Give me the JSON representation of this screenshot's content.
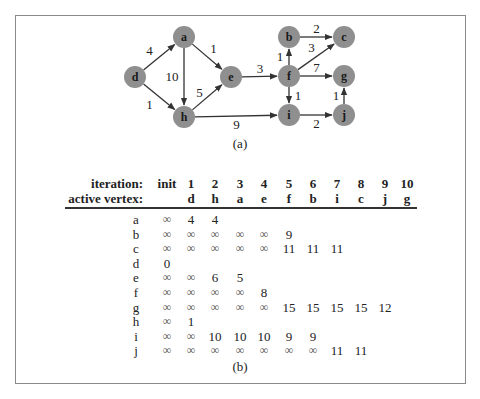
{
  "graph": {
    "caption": "(a)",
    "node_color": "#8f8f8f",
    "nodes": [
      {
        "id": "d",
        "x": 135,
        "y": 77
      },
      {
        "id": "a",
        "x": 184,
        "y": 37
      },
      {
        "id": "h",
        "x": 184,
        "y": 117
      },
      {
        "id": "e",
        "x": 231,
        "y": 77
      },
      {
        "id": "f",
        "x": 289,
        "y": 76
      },
      {
        "id": "b",
        "x": 289,
        "y": 37
      },
      {
        "id": "c",
        "x": 344,
        "y": 37
      },
      {
        "id": "g",
        "x": 344,
        "y": 76
      },
      {
        "id": "i",
        "x": 289,
        "y": 115
      },
      {
        "id": "j",
        "x": 344,
        "y": 115
      }
    ],
    "edges": [
      {
        "from": "d",
        "to": "a",
        "weight": "4"
      },
      {
        "from": "d",
        "to": "h",
        "weight": "1"
      },
      {
        "from": "a",
        "to": "h",
        "weight": "10"
      },
      {
        "from": "a",
        "to": "e",
        "weight": "1"
      },
      {
        "from": "h",
        "to": "e",
        "weight": "5"
      },
      {
        "from": "h",
        "to": "i",
        "weight": "9"
      },
      {
        "from": "e",
        "to": "f",
        "weight": "3"
      },
      {
        "from": "f",
        "to": "b",
        "weight": "1"
      },
      {
        "from": "f",
        "to": "c",
        "weight": "3"
      },
      {
        "from": "f",
        "to": "g",
        "weight": "7"
      },
      {
        "from": "f",
        "to": "i",
        "weight": "1"
      },
      {
        "from": "b",
        "to": "c",
        "weight": "2"
      },
      {
        "from": "i",
        "to": "j",
        "weight": "2"
      },
      {
        "from": "j",
        "to": "g",
        "weight": "1"
      }
    ]
  },
  "table": {
    "caption": "(b)",
    "iteration_label": "iteration:",
    "active_vertex_label": "active vertex:",
    "iterations": [
      "init",
      "1",
      "2",
      "3",
      "4",
      "5",
      "6",
      "7",
      "8",
      "9",
      "10"
    ],
    "active_vertices": [
      "",
      "d",
      "h",
      "a",
      "e",
      "f",
      "b",
      "i",
      "c",
      "j",
      "g"
    ],
    "rows": [
      {
        "vertex": "a",
        "values": [
          "∞",
          "4",
          "4"
        ]
      },
      {
        "vertex": "b",
        "values": [
          "∞",
          "∞",
          "∞",
          "∞",
          "∞",
          "9"
        ]
      },
      {
        "vertex": "c",
        "values": [
          "∞",
          "∞",
          "∞",
          "∞",
          "∞",
          "11",
          "11",
          "11"
        ]
      },
      {
        "vertex": "d",
        "values": [
          "0"
        ]
      },
      {
        "vertex": "e",
        "values": [
          "∞",
          "∞",
          "6",
          "5"
        ]
      },
      {
        "vertex": "f",
        "values": [
          "∞",
          "∞",
          "∞",
          "∞",
          "8"
        ]
      },
      {
        "vertex": "g",
        "values": [
          "∞",
          "∞",
          "∞",
          "∞",
          "∞",
          "15",
          "15",
          "15",
          "15",
          "12"
        ]
      },
      {
        "vertex": "h",
        "values": [
          "∞",
          "1"
        ]
      },
      {
        "vertex": "i",
        "values": [
          "∞",
          "∞",
          "10",
          "10",
          "10",
          "9",
          "9"
        ]
      },
      {
        "vertex": "j",
        "values": [
          "∞",
          "∞",
          "∞",
          "∞",
          "∞",
          "∞",
          "∞",
          "11",
          "11"
        ]
      }
    ]
  }
}
